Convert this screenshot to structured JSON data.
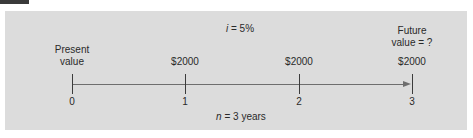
{
  "figure": {
    "rate_label": {
      "var": "i",
      "text": " = 5%"
    },
    "periods_label": {
      "var": "n",
      "text": " = 3 years"
    },
    "present_value_label": [
      "Present",
      "value"
    ],
    "future_value_label": [
      "Future",
      "value = ?"
    ],
    "ticks": [
      {
        "label": "0",
        "payment": ""
      },
      {
        "label": "1",
        "payment": "$2000"
      },
      {
        "label": "2",
        "payment": "$2000"
      },
      {
        "label": "3",
        "payment": "$2000"
      }
    ],
    "colors": {
      "panel": "#dcdcdc",
      "axis": "#6e6e6e",
      "tab": "#3a3a3a"
    }
  }
}
